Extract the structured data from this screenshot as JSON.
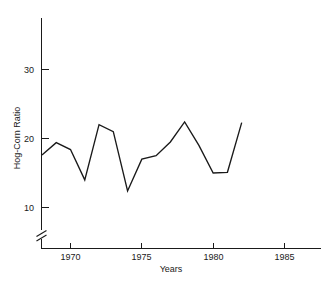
{
  "chart_data": {
    "type": "line",
    "title": "",
    "xlabel": "Years",
    "ylabel": "Hog-Corn Ratio",
    "xlim": [
      1968,
      1987.5
    ],
    "ylim": [
      8.5,
      38
    ],
    "grid": false,
    "legend": "none",
    "axis_break": true,
    "axis_break_note": "y-axis broken below 10",
    "xticks": [
      1970,
      1975,
      1980,
      1985
    ],
    "xtick_labels": [
      "1970",
      "1975",
      "1980",
      "1985"
    ],
    "yticks": [
      10,
      20,
      30
    ],
    "ytick_labels": [
      "10",
      "20",
      "30"
    ],
    "line_color": "#1a1a1a",
    "x": [
      1968,
      1969,
      1970,
      1971,
      1972,
      1973,
      1974,
      1975,
      1976,
      1977,
      1978,
      1979,
      1980,
      1981,
      1982
    ],
    "values": [
      17.6,
      19.4,
      18.4,
      14.0,
      22.0,
      21.0,
      12.4,
      17.0,
      17.5,
      19.5,
      22.4,
      19.0,
      15.0,
      15.1,
      22.3
    ],
    "series": [
      {
        "name": "Hog-Corn Ratio",
        "values": [
          17.6,
          19.4,
          18.4,
          14.0,
          22.0,
          21.0,
          12.4,
          17.0,
          17.5,
          19.5,
          22.4,
          19.0,
          15.0,
          15.1,
          22.3
        ]
      }
    ]
  },
  "axes": {
    "y_axis_title": "Hog-Corn Ratio",
    "x_axis_title": "Years",
    "y_tick_10": "10",
    "y_tick_20": "20",
    "y_tick_30": "30",
    "x_tick_1970": "1970",
    "x_tick_1975": "1975",
    "x_tick_1980": "1980",
    "x_tick_1985": "1985"
  }
}
